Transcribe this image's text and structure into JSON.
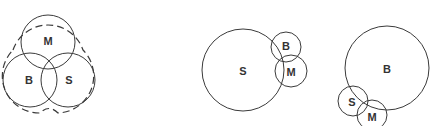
{
  "colors": {
    "stroke": "#3a3a3a",
    "label": "#333333",
    "background": "#ffffff"
  },
  "diagrams": [
    {
      "name": "balanced-overlap",
      "circles": [
        {
          "label": "M",
          "cx": 48,
          "cy": 42,
          "r": 27
        },
        {
          "label": "B",
          "cx": 30,
          "cy": 80,
          "r": 27
        },
        {
          "label": "S",
          "cx": 68,
          "cy": 80,
          "r": 27
        }
      ],
      "has_dashed_boundary": true
    },
    {
      "name": "s-dominant",
      "circles": [
        {
          "label": "S",
          "cx": 243,
          "cy": 70,
          "r": 41
        },
        {
          "label": "B",
          "cx": 286,
          "cy": 47,
          "r": 15
        },
        {
          "label": "M",
          "cx": 291,
          "cy": 71,
          "r": 16
        }
      ],
      "has_dashed_boundary": false
    },
    {
      "name": "b-dominant",
      "circles": [
        {
          "label": "B",
          "cx": 387,
          "cy": 68,
          "r": 42
        },
        {
          "label": "S",
          "cx": 353,
          "cy": 101,
          "r": 15
        },
        {
          "label": "M",
          "cx": 372,
          "cy": 115,
          "r": 15
        }
      ],
      "has_dashed_boundary": false
    }
  ]
}
